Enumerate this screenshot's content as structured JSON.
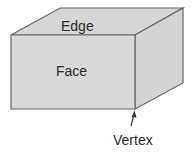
{
  "diagram": {
    "type": "labeled-3d-box",
    "colors": {
      "face_fill": "#d9d9d9",
      "top_fill": "#d6d6d6",
      "side_fill": "#d4d4d4",
      "stroke": "#666666",
      "text": "#2a2a2a",
      "background": "#ffffff"
    },
    "labels": {
      "edge": "Edge",
      "face": "Face",
      "vertex": "Vertex"
    },
    "geometry": {
      "front_face": "11,35 135,35 135,109 11,109",
      "top_face": "11,35 60,8 183,8 135,35",
      "right_face": "135,35 183,8 183,83 135,109"
    }
  }
}
